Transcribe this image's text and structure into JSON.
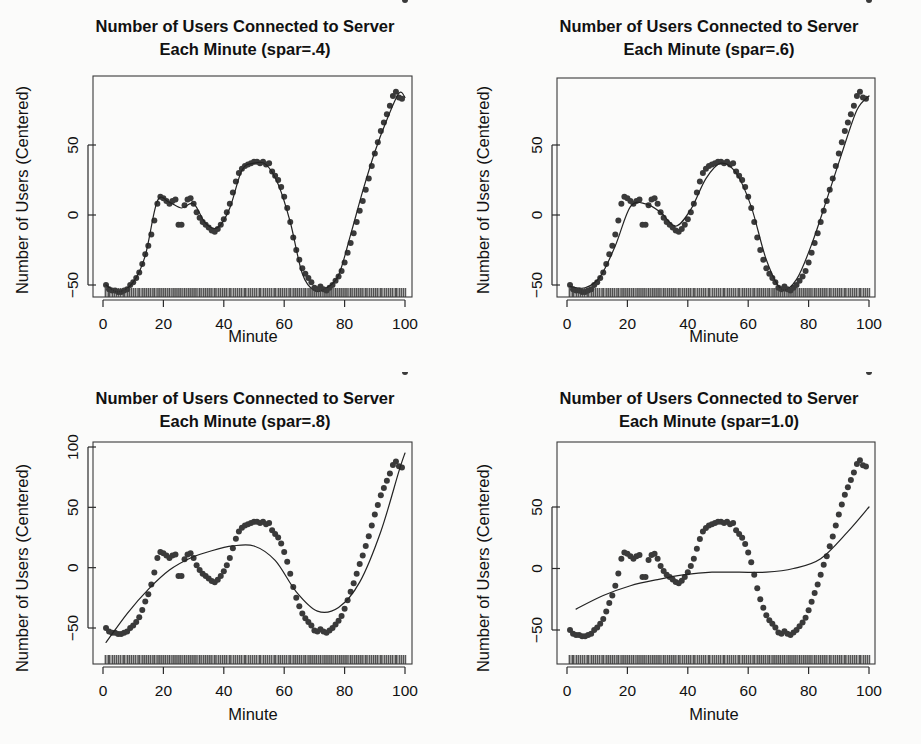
{
  "figure": {
    "title_line1": "Number of Users Connected to Server",
    "xlabel": "Minute",
    "ylabel": "Number of Users (Centered)"
  },
  "panels": [
    {
      "id": "spar-0.4",
      "title_line1": "Number of Users Connected to Server",
      "title_line2": "Each Minute (spar=.4)",
      "xlabel": "Minute",
      "ylabel": "Number of Users (Centered)",
      "spar": 0.4,
      "xticks": [
        "0",
        "20",
        "40",
        "60",
        "80",
        "100"
      ],
      "yticks": [
        "-50",
        "0",
        "50"
      ]
    },
    {
      "id": "spar-0.6",
      "title_line1": "Number of Users Connected to Server",
      "title_line2": "Each Minute (spar=.6)",
      "xlabel": "Minute",
      "ylabel": "Number of Users (Centered)",
      "spar": 0.6,
      "xticks": [
        "0",
        "20",
        "40",
        "60",
        "80",
        "100"
      ],
      "yticks": [
        "-50",
        "0",
        "50"
      ]
    },
    {
      "id": "spar-0.8",
      "title_line1": "Number of Users Connected to Server",
      "title_line2": "Each Minute (spar=.8)",
      "xlabel": "Minute",
      "ylabel": "Number of Users (Centered)",
      "spar": 0.8,
      "xticks": [
        "0",
        "20",
        "40",
        "60",
        "80",
        "100"
      ],
      "yticks": [
        "-50",
        "0",
        "50",
        "100"
      ]
    },
    {
      "id": "spar-1.0",
      "title_line1": "Number of Users Connected to Server",
      "title_line2": "Each Minute (spar=1.0)",
      "xlabel": "Minute",
      "ylabel": "Number of Users (Centered)",
      "spar": 1.0,
      "xticks": [
        "0",
        "20",
        "40",
        "60",
        "80",
        "100"
      ],
      "yticks": [
        "-50",
        "0",
        "50"
      ]
    }
  ],
  "chart_data": {
    "type": "scatter",
    "layout": "2x2 grid of scatter plots with smoothing-spline fits",
    "title": "Number of Users Connected to Server Each Minute",
    "xlabel": "Minute",
    "ylabel": "Number of Users (Centered)",
    "grid": false,
    "legend": false,
    "xlim": [
      0,
      101
    ],
    "point_color": "#3a3a3a",
    "line_color": "#232323",
    "rug": true,
    "x": [
      1,
      2,
      3,
      4,
      5,
      6,
      7,
      8,
      9,
      10,
      11,
      12,
      13,
      14,
      15,
      16,
      17,
      18,
      19,
      20,
      21,
      22,
      23,
      24,
      25,
      26,
      27,
      28,
      29,
      30,
      31,
      32,
      33,
      34,
      35,
      36,
      37,
      38,
      39,
      40,
      41,
      42,
      43,
      44,
      45,
      46,
      47,
      48,
      49,
      50,
      51,
      52,
      53,
      54,
      55,
      56,
      57,
      58,
      59,
      60,
      61,
      62,
      63,
      64,
      65,
      66,
      67,
      68,
      69,
      70,
      71,
      72,
      73,
      74,
      75,
      76,
      77,
      78,
      79,
      80,
      81,
      82,
      83,
      84,
      85,
      86,
      87,
      88,
      89,
      90,
      91,
      92,
      93,
      94,
      95,
      96,
      97,
      98,
      99,
      100
    ],
    "y": [
      -50,
      -53,
      -54,
      -54,
      -55,
      -55,
      -54,
      -53,
      -50,
      -48,
      -45,
      -41,
      -35,
      -28,
      -22,
      -14,
      -4,
      8,
      13,
      12,
      10,
      8,
      10,
      11,
      -7,
      -7,
      7,
      11,
      12,
      8,
      2,
      -2,
      -5,
      -7,
      -9,
      -11,
      -12,
      -10,
      -7,
      -3,
      2,
      8,
      16,
      24,
      30,
      33,
      35,
      36,
      37,
      38,
      38,
      37,
      38,
      36,
      37,
      31,
      28,
      25,
      20,
      13,
      5,
      -5,
      -16,
      -25,
      -32,
      -38,
      -42,
      -45,
      -48,
      -52,
      -53,
      -51,
      -53,
      -54,
      -52,
      -50,
      -47,
      -44,
      -40,
      -34,
      -27,
      -20,
      -13,
      -5,
      3,
      10,
      18,
      26,
      35,
      44,
      52,
      60,
      66,
      72,
      78,
      85,
      88,
      84,
      83
    ],
    "panels": [
      {
        "name": "spar=.4",
        "spar": 0.4,
        "ylim": [
          -62,
          95
        ],
        "yticks": [
          -50,
          0,
          50
        ],
        "xticks": [
          0,
          20,
          40,
          60,
          80,
          100
        ],
        "smooth_x": [
          1,
          5,
          10,
          14,
          18,
          22,
          26,
          30,
          34,
          38,
          42,
          46,
          50,
          54,
          58,
          62,
          66,
          70,
          74,
          78,
          82,
          86,
          90,
          94,
          98,
          100
        ],
        "smooth_y": [
          -50,
          -55,
          -48,
          -29,
          10,
          9,
          5,
          8,
          -6,
          -9,
          5,
          32,
          37,
          36,
          22,
          -5,
          -42,
          -54,
          -52,
          -43,
          -14,
          17,
          45,
          68,
          87,
          84
        ]
      },
      {
        "name": "spar=.6",
        "spar": 0.6,
        "ylim": [
          -62,
          95
        ],
        "yticks": [
          -50,
          0,
          50
        ],
        "xticks": [
          0,
          20,
          40,
          60,
          80,
          100
        ],
        "smooth_x": [
          1,
          6,
          11,
          16,
          21,
          26,
          31,
          36,
          41,
          46,
          51,
          56,
          61,
          66,
          71,
          76,
          81,
          86,
          91,
          96,
          100
        ],
        "smooth_y": [
          -51,
          -52,
          -44,
          -22,
          6,
          8,
          2,
          -8,
          4,
          26,
          37,
          30,
          6,
          -32,
          -53,
          -46,
          -21,
          11,
          44,
          75,
          85
        ]
      },
      {
        "name": "spar=.8",
        "spar": 0.8,
        "ylim": [
          -62,
          108
        ],
        "yticks": [
          -50,
          0,
          50,
          100
        ],
        "xticks": [
          0,
          20,
          40,
          60,
          80,
          100
        ],
        "smooth_x": [
          1,
          8,
          15,
          22,
          29,
          36,
          43,
          50,
          57,
          64,
          71,
          78,
          85,
          92,
          98,
          100
        ],
        "smooth_y": [
          -62,
          -38,
          -18,
          -2,
          8,
          14,
          18,
          18,
          6,
          -20,
          -36,
          -33,
          -12,
          30,
          80,
          95
        ]
      },
      {
        "name": "spar=1.0",
        "spar": 1.0,
        "ylim": [
          -62,
          95
        ],
        "yticks": [
          -50,
          0,
          50
        ],
        "xticks": [
          0,
          20,
          40,
          60,
          80,
          100
        ],
        "smooth_x": [
          3,
          12,
          21,
          30,
          39,
          48,
          57,
          66,
          75,
          84,
          93,
          100
        ],
        "smooth_y": [
          -33,
          -22,
          -14,
          -9,
          -5,
          -3,
          -3,
          -3,
          0,
          8,
          30,
          50
        ]
      }
    ]
  }
}
